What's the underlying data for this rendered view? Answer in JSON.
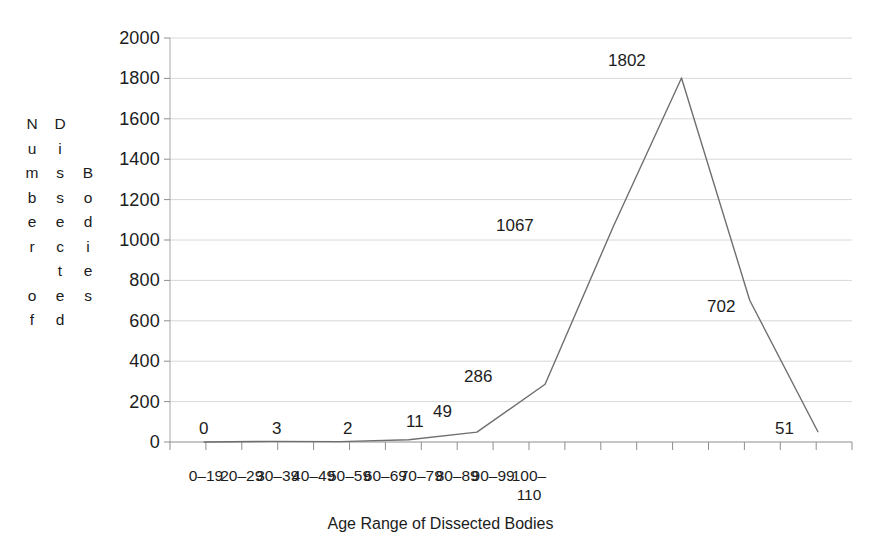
{
  "chart_data": {
    "type": "line",
    "title": "",
    "xlabel": "Age Range of Dissected Bodies",
    "ylabel": "Number of Dissected Bodies",
    "ylabel_columns": [
      [
        "N",
        "u",
        "m",
        "b",
        "e",
        "r",
        "",
        "o",
        "f"
      ],
      [
        "D",
        "i",
        "s",
        "s",
        "e",
        "c",
        "t",
        "e",
        "d"
      ],
      [
        "B",
        "o",
        "d",
        "i",
        "e",
        "s"
      ]
    ],
    "categories": [
      "0–19",
      "20–29",
      "30–39",
      "40–49",
      "50–59",
      "60–69",
      "70–79",
      "80–89",
      "90–99",
      "100–\n110"
    ],
    "values": [
      0,
      3,
      2,
      11,
      49,
      286,
      1067,
      1802,
      702,
      51
    ],
    "data_labels": [
      "0",
      "3",
      "2",
      "11",
      "49",
      "286",
      "1067",
      "1802",
      "702",
      "51"
    ],
    "ylim": [
      0,
      2000
    ],
    "y_ticks": [
      0,
      200,
      400,
      600,
      800,
      1000,
      1200,
      1400,
      1600,
      1800,
      2000
    ],
    "y_tick_labels": [
      "0",
      "200",
      "400",
      "600",
      "800",
      "1000",
      "1200",
      "1400",
      "1600",
      "1800",
      "2000"
    ],
    "grid": true,
    "legend": false,
    "line_color": "#6f6f6f",
    "grid_color": "#d8d8d8",
    "axis_color": "#9a9a9a",
    "text_color": "#1c1c1c",
    "background_color": "#ffffff"
  }
}
